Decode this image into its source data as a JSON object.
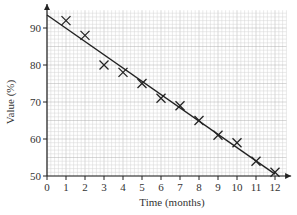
{
  "chart_data": {
    "type": "scatter",
    "title": "",
    "xlabel": "Time (months)",
    "ylabel": "Value (%)",
    "xlim": [
      0,
      12
    ],
    "ylim": [
      50,
      95
    ],
    "x_ticks": [
      0,
      1,
      2,
      3,
      4,
      5,
      6,
      7,
      8,
      9,
      10,
      11,
      12
    ],
    "y_ticks": [
      50,
      60,
      70,
      80,
      90
    ],
    "grid": true,
    "legend": null,
    "series": [
      {
        "name": "observations",
        "marker": "x",
        "x": [
          1,
          2,
          3,
          4,
          5,
          6,
          7,
          8,
          9,
          10,
          11,
          12
        ],
        "y": [
          92,
          88,
          80,
          78,
          75,
          71,
          69,
          65,
          61,
          59,
          54,
          51
        ]
      }
    ],
    "trend_line": {
      "x": [
        0,
        12
      ],
      "y": [
        93.5,
        50.5
      ]
    }
  },
  "colors": {
    "grid_minor": "#d4d4d4",
    "grid_major": "#b0b0b0",
    "ink": "#222222"
  }
}
